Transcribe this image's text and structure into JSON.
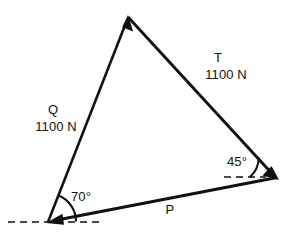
{
  "figure": {
    "type": "force-triangle-diagram",
    "background_color": "#ffffff",
    "stroke_color": "#111111",
    "vectors": [
      {
        "name": "Q",
        "label": "Q",
        "magnitude_label": "1100 N",
        "magnitude_value": 1100,
        "unit": "N",
        "from": [
          48,
          222
        ],
        "to": [
          128,
          17
        ],
        "arrow_at": "to"
      },
      {
        "name": "T",
        "label": "T",
        "magnitude_label": "1100 N",
        "magnitude_value": 1100,
        "unit": "N",
        "from": [
          128,
          17
        ],
        "to": [
          277,
          178
        ],
        "arrow_at": "to"
      },
      {
        "name": "P",
        "label": "P",
        "magnitude_label": "",
        "unit": "N",
        "from": [
          277,
          178
        ],
        "to": [
          48,
          222
        ],
        "arrow_at": "to"
      }
    ],
    "angles": [
      {
        "name": "angle-70",
        "label": "70°",
        "value": 70,
        "unit": "degrees",
        "vertex": [
          48,
          222
        ],
        "reference": "horizontal-dashed"
      },
      {
        "name": "angle-45",
        "label": "45°",
        "value": 45,
        "unit": "degrees",
        "vertex": [
          277,
          178
        ],
        "reference": "horizontal-dashed"
      }
    ],
    "reference_lines": [
      {
        "name": "dashed-horizontal-left",
        "style": "dashed",
        "from": [
          8,
          222
        ],
        "to": [
          100,
          222
        ]
      },
      {
        "name": "dashed-horizontal-right",
        "style": "dashed",
        "from": [
          224,
          177
        ],
        "to": [
          266,
          177
        ]
      }
    ]
  }
}
